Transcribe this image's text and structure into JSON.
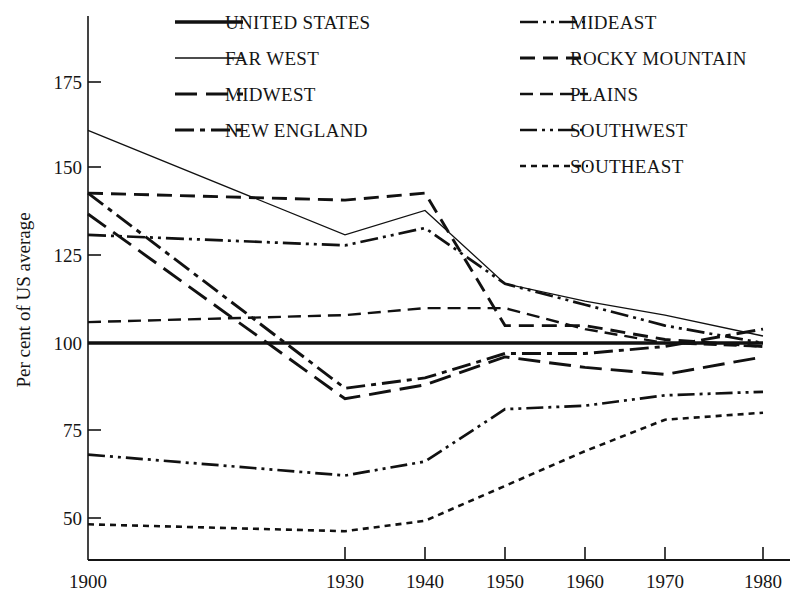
{
  "chart_data": {
    "type": "line",
    "title": "",
    "xlabel": "",
    "ylabel": "Per cent of US average",
    "x": [
      1900,
      1930,
      1940,
      1950,
      1960,
      1970,
      1980
    ],
    "xticklabels": [
      "1900",
      "1930",
      "1940",
      "1950",
      "1960",
      "1970",
      "1980"
    ],
    "yticks": [
      50,
      75,
      100,
      125,
      150,
      175
    ],
    "yticklabels": [
      "50",
      "75",
      "100",
      "125",
      "150",
      "175"
    ],
    "ylim": [
      38,
      185
    ],
    "xlim": [
      1896,
      1983
    ],
    "grid": false,
    "legend_position": "top, two columns inside plot",
    "series": [
      {
        "name": "UNITED STATES",
        "style": "solid-thick",
        "values": [
          100,
          100,
          100,
          100,
          100,
          100,
          100
        ]
      },
      {
        "name": "FAR WEST",
        "style": "solid-thin",
        "values": [
          161,
          131,
          138,
          117,
          112,
          108,
          102
        ]
      },
      {
        "name": "MIDWEST",
        "style": "long-dash",
        "values": [
          137,
          84,
          88,
          96,
          93,
          91,
          96
        ]
      },
      {
        "name": "NEW ENGLAND",
        "style": "dash-dot",
        "values": [
          143,
          87,
          90,
          97,
          97,
          99,
          104
        ]
      },
      {
        "name": "MIDEAST",
        "style": "dash-dot-dot",
        "values": [
          131,
          128,
          133,
          117,
          111,
          105,
          100
        ]
      },
      {
        "name": "ROCKY MOUNTAIN",
        "style": "medium-dash",
        "values": [
          143,
          141,
          143,
          105,
          105,
          101,
          99
        ]
      },
      {
        "name": "PLAINS",
        "style": "dashed",
        "values": [
          106,
          108,
          110,
          110,
          104,
          100,
          99
        ]
      },
      {
        "name": "SOUTHWEST",
        "style": "dash-dot-dot-thin",
        "values": [
          68,
          62,
          66,
          81,
          82,
          85,
          86
        ]
      },
      {
        "name": "SOUTHEAST",
        "style": "dotted",
        "values": [
          48,
          46,
          49,
          59,
          69,
          78,
          80
        ]
      }
    ]
  },
  "legend": {
    "column_left": [
      "UNITED STATES",
      "FAR WEST",
      "MIDWEST",
      "NEW ENGLAND"
    ],
    "column_right": [
      "MIDEAST",
      "ROCKY MOUNTAIN",
      "PLAINS",
      "SOUTHWEST",
      "SOUTHEAST"
    ]
  },
  "axes": {
    "y_title": "Per cent of US average",
    "y_labels": [
      "175",
      "150",
      "125",
      "100",
      "75",
      "50"
    ],
    "x_labels": [
      "1900",
      "1930",
      "1940",
      "1950",
      "1960",
      "1970",
      "1980"
    ]
  },
  "colors": {
    "ink": "#111111",
    "background": "#ffffff"
  }
}
